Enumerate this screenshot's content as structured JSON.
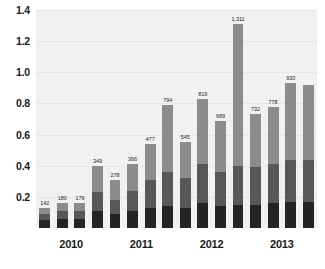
{
  "chart_data": {
    "type": "bar",
    "subtype": "stacked-bar",
    "title": "",
    "xlabel": "",
    "ylabel": "",
    "ylim": [
      0,
      1.4
    ],
    "ytick_labels": [
      "0.2",
      "0.4",
      "0.6",
      "0.8",
      "1.0",
      "1.2",
      "1.4"
    ],
    "ytick_values": [
      0.2,
      0.4,
      0.6,
      0.8,
      1.0,
      1.2,
      1.4
    ],
    "grid": true,
    "legend": "none",
    "categories": [
      "2010 Q1",
      "2010 Q2",
      "2010 Q3",
      "2010 Q4",
      "2011 Q1",
      "2011 Q2",
      "2011 Q3",
      "2011 Q4",
      "2012 Q1",
      "2012 Q2",
      "2012 Q3",
      "2012 Q4",
      "2013 Q1",
      "2013 Q2",
      "2013 Q3",
      "2013 Q4"
    ],
    "x_group_labels": [
      "2010",
      "2011",
      "2012",
      "2013"
    ],
    "data_labels": [
      "142",
      "180",
      "179",
      "349",
      "278",
      "366",
      "477",
      "794",
      "545",
      "819",
      "689",
      "1,311",
      "732",
      "778",
      "930",
      ""
    ],
    "values": [
      0.13,
      0.16,
      0.16,
      0.4,
      0.31,
      0.41,
      0.54,
      0.79,
      0.55,
      0.83,
      0.69,
      1.31,
      0.73,
      0.78,
      0.93,
      0.92
    ],
    "series": [
      {
        "name": "bottom-segment",
        "color": "#242424",
        "values": [
          0.05,
          0.06,
          0.06,
          0.11,
          0.09,
          0.11,
          0.13,
          0.14,
          0.13,
          0.16,
          0.14,
          0.15,
          0.15,
          0.16,
          0.17,
          0.17
        ]
      },
      {
        "name": "middle-segment",
        "color": "#575757",
        "values": [
          0.04,
          0.05,
          0.05,
          0.12,
          0.09,
          0.13,
          0.18,
          0.22,
          0.19,
          0.25,
          0.22,
          0.25,
          0.24,
          0.25,
          0.27,
          0.27
        ]
      },
      {
        "name": "top-segment",
        "color": "#8c8c8c",
        "values": [
          0.04,
          0.05,
          0.05,
          0.17,
          0.13,
          0.17,
          0.23,
          0.43,
          0.23,
          0.42,
          0.33,
          0.91,
          0.34,
          0.37,
          0.49,
          0.48
        ]
      }
    ],
    "colors": {
      "plot_background": "#f1f1f1",
      "page_background": "#ffffff",
      "gridline": "#e6e6e6",
      "axis_text": "#1a1a1a",
      "segment_top": "#8c8c8c",
      "segment_mid": "#575757",
      "segment_bottom": "#242424"
    }
  }
}
